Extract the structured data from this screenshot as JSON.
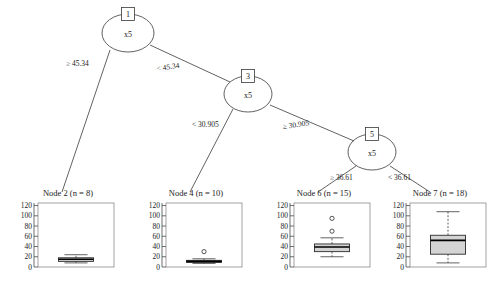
{
  "figure": {
    "type": "decision-tree-with-boxplots",
    "background": "#ffffff",
    "line_color": "#3a3a3a",
    "box_fill": "#d4d4d4"
  },
  "tree": {
    "inner_nodes": [
      {
        "id": "1",
        "variable": "x5",
        "cx": 128,
        "cy": 33,
        "rx": 26,
        "ry": 19
      },
      {
        "id": "3",
        "variable": "x5",
        "cx": 248,
        "cy": 94,
        "rx": 24,
        "ry": 18
      },
      {
        "id": "5",
        "variable": "x5",
        "cx": 372,
        "cy": 152,
        "rx": 24,
        "ry": 18
      }
    ],
    "edges": [
      {
        "from": "1",
        "to": "2",
        "label": "≥ 45.34",
        "label_x": 66,
        "label_y": 66,
        "x1": 110,
        "y1": 50,
        "x2": 62,
        "y2": 192
      },
      {
        "from": "1",
        "to": "3",
        "label": "< 45.34",
        "label_x": 157,
        "label_y": 71,
        "x1": 150,
        "y1": 45,
        "x2": 230,
        "y2": 82
      },
      {
        "from": "3",
        "to": "4",
        "label": "< 30.905",
        "label_x": 192,
        "label_y": 127,
        "x1": 233,
        "y1": 109,
        "x2": 190,
        "y2": 192
      },
      {
        "from": "3",
        "to": "5",
        "label": "≥ 30.905",
        "label_x": 283,
        "label_y": 129,
        "x1": 270,
        "y1": 105,
        "x2": 354,
        "y2": 141
      },
      {
        "from": "5",
        "to": "6",
        "label": "≥ 36.61",
        "label_x": 330,
        "label_y": 180,
        "x1": 356,
        "y1": 166,
        "x2": 318,
        "y2": 192
      },
      {
        "from": "5",
        "to": "7",
        "label": "< 36.61",
        "label_x": 388,
        "label_y": 180,
        "x1": 390,
        "y1": 166,
        "x2": 430,
        "y2": 192
      }
    ],
    "variable_label": "x5"
  },
  "leaves": [
    {
      "id": "2",
      "title": "Node 2 (n = 8)",
      "n": 8,
      "panel": {
        "x": 2,
        "y": 199,
        "w": 116,
        "h": 84
      }
    },
    {
      "id": "4",
      "title": "Node 4 (n = 10)",
      "n": 10,
      "panel": {
        "x": 130,
        "y": 199,
        "w": 116,
        "h": 84
      }
    },
    {
      "id": "6",
      "title": "Node 6 (n = 15)",
      "n": 15,
      "panel": {
        "x": 258,
        "y": 199,
        "w": 116,
        "h": 84
      }
    },
    {
      "id": "7",
      "title": "Node 7 (n = 18)",
      "n": 18,
      "panel": {
        "x": 374,
        "y": 199,
        "w": 116,
        "h": 84
      }
    }
  ],
  "chart_data": {
    "type": "boxplot",
    "xlabel": "",
    "ylabel": "",
    "ylim": [
      0,
      125
    ],
    "yticks": [
      0,
      20,
      40,
      60,
      80,
      100,
      120
    ],
    "ytick_labels": [
      "0",
      "20",
      "40",
      "60",
      "80",
      "100",
      "120"
    ],
    "grid": false,
    "legend": null,
    "panels": [
      {
        "name": "Node 2 (n = 8)",
        "n": 8,
        "lower_whisker": 8,
        "q1": 11,
        "median": 15,
        "q3": 18,
        "upper_whisker": 24,
        "outliers": []
      },
      {
        "name": "Node 4 (n = 10)",
        "n": 10,
        "lower_whisker": 7,
        "q1": 9,
        "median": 11,
        "q3": 13,
        "upper_whisker": 16,
        "outliers": [
          30
        ]
      },
      {
        "name": "Node 6 (n = 15)",
        "n": 15,
        "lower_whisker": 20,
        "q1": 30,
        "median": 39,
        "q3": 45,
        "upper_whisker": 57,
        "outliers": [
          95,
          70
        ]
      },
      {
        "name": "Node 7 (n = 18)",
        "n": 18,
        "lower_whisker": 8,
        "q1": 25,
        "median": 52,
        "q3": 62,
        "upper_whisker": 108,
        "outliers": []
      }
    ]
  }
}
